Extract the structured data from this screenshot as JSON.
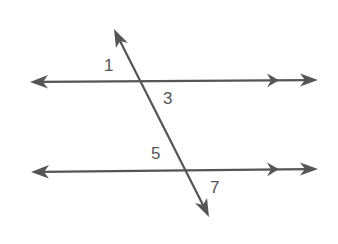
{
  "diagram": {
    "type": "parallel-lines-cut-by-transversal",
    "stroke_color": "#555555",
    "background": "#ffffff",
    "lines": {
      "upper": {
        "from": [
          30,
          82
        ],
        "to": [
          318,
          80
        ],
        "parallel_marker_x": 272
      },
      "lower": {
        "from": [
          31,
          172
        ],
        "to": [
          318,
          169
        ],
        "parallel_marker_x": 272
      },
      "transversal": {
        "from": [
          114,
          29
        ],
        "to": [
          209,
          217
        ]
      }
    },
    "angle_labels": [
      {
        "id": "1",
        "text": "1",
        "x": 104,
        "y": 57
      },
      {
        "id": "3",
        "text": "3",
        "x": 163,
        "y": 90
      },
      {
        "id": "5",
        "text": "5",
        "x": 151,
        "y": 145
      },
      {
        "id": "7",
        "text": "7",
        "x": 210,
        "y": 179
      }
    ]
  }
}
